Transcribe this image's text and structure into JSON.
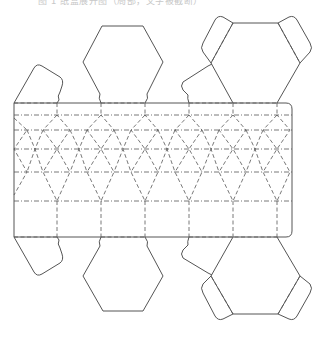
{
  "caption": "图 1  纸盒展开图（局部，文字被截断）",
  "diagram": {
    "type": "papercraft net",
    "line_color": "#555555",
    "background": "#ffffff",
    "line_styles": [
      "solid cut line",
      "dashed fold line",
      "dash-dot fold line"
    ],
    "body": {
      "x": 14,
      "y": 103,
      "width": 278,
      "height": 134
    },
    "columns_x": [
      14,
      57,
      101,
      145,
      189,
      233,
      277
    ],
    "rows_y": [
      103,
      115,
      130,
      149,
      172,
      201,
      237
    ]
  }
}
